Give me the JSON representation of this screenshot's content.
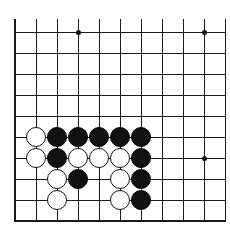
{
  "figure": {
    "type": "go-board-diagram",
    "background_color": "#ffffff",
    "line_color": "#1a1a1a",
    "black_stone_color": "#111111",
    "white_stone_color": "#ffffff",
    "white_stone_border_color": "#111111"
  },
  "board": {
    "description": "Partial go board grid, lower-left corner region of a 19x19 board",
    "columns": 11,
    "rows": 10,
    "cell_size": 21,
    "origin_x": 15,
    "origin_y": 32,
    "stone_radius": 10,
    "column_x": [
      15,
      36,
      57,
      78,
      99,
      120,
      141,
      162,
      183,
      204,
      225
    ],
    "row_y": [
      32,
      53,
      74,
      95,
      116,
      137,
      158,
      179,
      200,
      221
    ],
    "edges": {
      "left": true,
      "top": false,
      "right": false,
      "bottom": true
    }
  },
  "star_points": [
    {
      "col": 3,
      "row": 0,
      "x": 78,
      "y": 32
    },
    {
      "col": 9,
      "row": 0,
      "x": 204,
      "y": 32
    },
    {
      "col": 9,
      "row": 6,
      "x": 204,
      "y": 158
    }
  ],
  "stones": [
    {
      "color": "white",
      "col": 1,
      "row": 5,
      "x": 36,
      "y": 137
    },
    {
      "color": "black",
      "col": 2,
      "row": 5,
      "x": 57,
      "y": 137
    },
    {
      "color": "black",
      "col": 3,
      "row": 5,
      "x": 78,
      "y": 137
    },
    {
      "color": "black",
      "col": 4,
      "row": 5,
      "x": 99,
      "y": 137
    },
    {
      "color": "black",
      "col": 5,
      "row": 5,
      "x": 120,
      "y": 137
    },
    {
      "color": "black",
      "col": 6,
      "row": 5,
      "x": 141,
      "y": 137
    },
    {
      "color": "white",
      "col": 1,
      "row": 6,
      "x": 36,
      "y": 158
    },
    {
      "color": "black",
      "col": 2,
      "row": 6,
      "x": 57,
      "y": 158
    },
    {
      "color": "white",
      "col": 3,
      "row": 6,
      "x": 78,
      "y": 158
    },
    {
      "color": "white",
      "col": 4,
      "row": 6,
      "x": 99,
      "y": 158
    },
    {
      "color": "white",
      "col": 5,
      "row": 6,
      "x": 120,
      "y": 158
    },
    {
      "color": "black",
      "col": 6,
      "row": 6,
      "x": 141,
      "y": 158
    },
    {
      "color": "white",
      "col": 2,
      "row": 7,
      "x": 57,
      "y": 179
    },
    {
      "color": "black",
      "col": 3,
      "row": 7,
      "x": 78,
      "y": 179
    },
    {
      "color": "white",
      "col": 5,
      "row": 7,
      "x": 120,
      "y": 179
    },
    {
      "color": "black",
      "col": 6,
      "row": 7,
      "x": 141,
      "y": 179
    },
    {
      "color": "white",
      "col": 2,
      "row": 8,
      "x": 57,
      "y": 200
    },
    {
      "color": "white",
      "col": 5,
      "row": 8,
      "x": 120,
      "y": 200
    },
    {
      "color": "black",
      "col": 6,
      "row": 8,
      "x": 141,
      "y": 200
    }
  ],
  "counts": {
    "black_stones": 12,
    "white_stones": 9,
    "total_stones": 21
  }
}
